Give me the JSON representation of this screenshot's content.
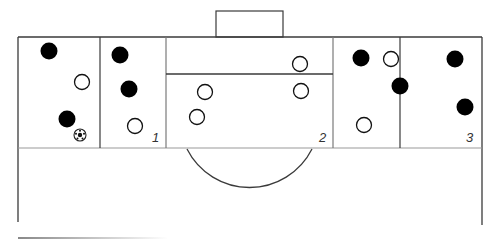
{
  "diagram": {
    "title": "",
    "colors": {
      "line": "#3a3a3a",
      "team_dark": "#000000",
      "team_light_fill": "#ffffff",
      "background": "#ffffff"
    },
    "zones": [
      {
        "id": "1",
        "label": "1",
        "x_from": 100,
        "x_to": 166
      },
      {
        "id": "2",
        "label": "2",
        "x_from": 166,
        "x_to": 333
      },
      {
        "id": "3",
        "label": "3",
        "x_from": 400,
        "x_to": 482
      }
    ],
    "players_dark": [
      {
        "x": 49,
        "y": 51
      },
      {
        "x": 120,
        "y": 55
      },
      {
        "x": 129,
        "y": 89
      },
      {
        "x": 67,
        "y": 119
      },
      {
        "x": 361,
        "y": 58
      },
      {
        "x": 400,
        "y": 86
      },
      {
        "x": 455,
        "y": 59
      },
      {
        "x": 465,
        "y": 107
      }
    ],
    "players_light": [
      {
        "x": 82,
        "y": 82
      },
      {
        "x": 135,
        "y": 126
      },
      {
        "x": 300,
        "y": 64
      },
      {
        "x": 205,
        "y": 92
      },
      {
        "x": 301,
        "y": 91
      },
      {
        "x": 197,
        "y": 117
      },
      {
        "x": 391,
        "y": 59
      },
      {
        "x": 364,
        "y": 125
      }
    ],
    "ball": {
      "x": 80,
      "y": 135,
      "icon": "soccer-ball-icon"
    }
  }
}
